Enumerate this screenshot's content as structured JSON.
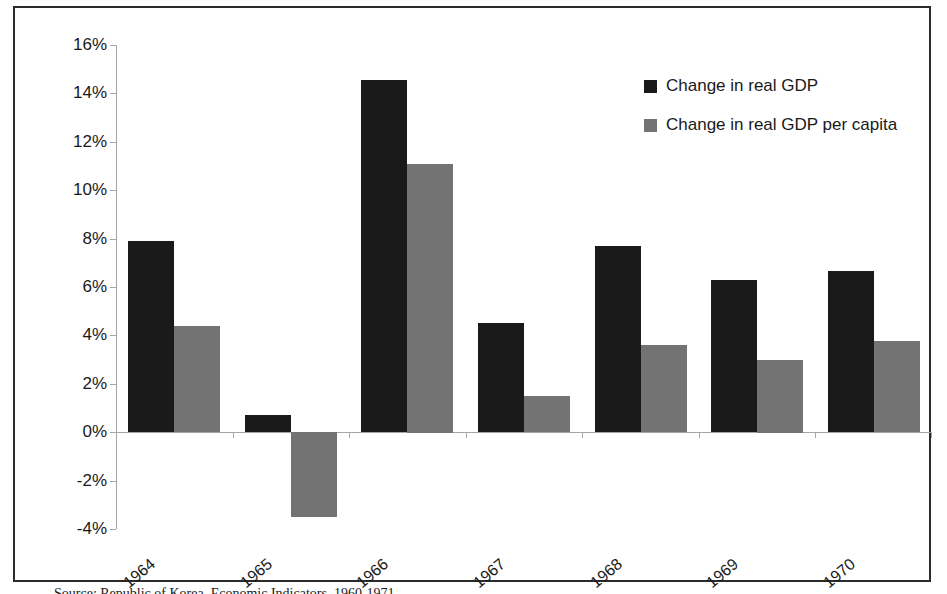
{
  "chart_data": {
    "type": "bar",
    "title": "",
    "subtitle": "",
    "xlabel": "",
    "ylabel": "",
    "categories": [
      "1964",
      "1965",
      "1966",
      "1967",
      "1968",
      "1969",
      "1970"
    ],
    "series": [
      {
        "name": "Change in real GDP",
        "color": "#1a1a1a",
        "values": [
          7.9,
          0.7,
          14.55,
          4.5,
          7.7,
          6.3,
          6.65
        ]
      },
      {
        "name": "Change in real GDP per capita",
        "color": "#737373",
        "values": [
          4.4,
          -3.5,
          11.1,
          1.5,
          3.6,
          3.0,
          3.75
        ]
      }
    ],
    "ylim": [
      -4,
      16
    ],
    "ytick_step": 2,
    "ytick_labels": [
      "16%",
      "14%",
      "12%",
      "10%",
      "8%",
      "6%",
      "4%",
      "2%",
      "0%",
      "-2%",
      "-4%"
    ],
    "ytick_values": [
      16,
      14,
      12,
      10,
      8,
      6,
      4,
      2,
      0,
      -2,
      -4
    ],
    "grid": false,
    "legend_position": "top-right",
    "value_suffix": "%"
  },
  "legend": {
    "items": [
      {
        "label": "Change in real GDP",
        "color": "#1a1a1a"
      },
      {
        "label": "Change in real GDP per capita",
        "color": "#737373"
      }
    ]
  },
  "caption": {
    "text": "Source: Republic of Korea, Economic Indicators, 1960-1971"
  },
  "colors": {
    "series_primary": "#1a1a1a",
    "series_secondary": "#737373",
    "axis": "#a6a6a6",
    "frame": "#2b2b2b",
    "background": "#ffffff"
  }
}
